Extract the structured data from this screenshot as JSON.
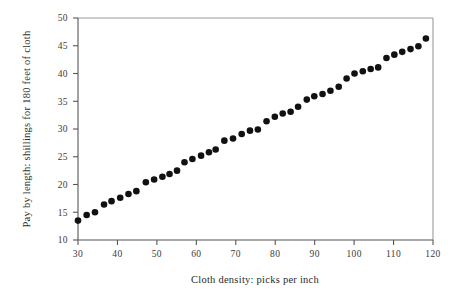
{
  "chart_data": {
    "type": "scatter",
    "title": "",
    "xlabel": "Cloth density: picks per inch",
    "ylabel": "Pay by length: shillings for 180 feet of cloth",
    "xlim": [
      30,
      120
    ],
    "ylim": [
      10,
      50
    ],
    "xticks": [
      30,
      40,
      50,
      60,
      70,
      80,
      90,
      100,
      110,
      120
    ],
    "yticks": [
      10,
      15,
      20,
      25,
      30,
      35,
      40,
      45,
      50
    ],
    "xtick_labels": [
      "30",
      "40",
      "50",
      "60",
      "70",
      "80",
      "90",
      "100",
      "110",
      "120"
    ],
    "ytick_labels": [
      "10",
      "15",
      "20",
      "25",
      "30",
      "35",
      "40",
      "45",
      "50"
    ],
    "grid": false,
    "legend": null,
    "marker": {
      "shape": "circle",
      "color": "#111111",
      "size": 3.3
    },
    "points": [
      {
        "x": 30.0,
        "y": 13.5
      },
      {
        "x": 32.2,
        "y": 14.5
      },
      {
        "x": 34.3,
        "y": 15.0
      },
      {
        "x": 36.6,
        "y": 16.4
      },
      {
        "x": 38.5,
        "y": 17.0
      },
      {
        "x": 40.7,
        "y": 17.6
      },
      {
        "x": 42.8,
        "y": 18.3
      },
      {
        "x": 44.8,
        "y": 18.8
      },
      {
        "x": 47.2,
        "y": 20.4
      },
      {
        "x": 49.3,
        "y": 20.9
      },
      {
        "x": 51.4,
        "y": 21.4
      },
      {
        "x": 53.2,
        "y": 21.9
      },
      {
        "x": 55.1,
        "y": 22.5
      },
      {
        "x": 57.0,
        "y": 24.0
      },
      {
        "x": 59.0,
        "y": 24.6
      },
      {
        "x": 61.2,
        "y": 25.2
      },
      {
        "x": 63.2,
        "y": 25.8
      },
      {
        "x": 64.9,
        "y": 26.3
      },
      {
        "x": 67.1,
        "y": 27.9
      },
      {
        "x": 69.3,
        "y": 28.3
      },
      {
        "x": 71.5,
        "y": 29.1
      },
      {
        "x": 73.6,
        "y": 29.7
      },
      {
        "x": 75.6,
        "y": 29.9
      },
      {
        "x": 77.8,
        "y": 31.4
      },
      {
        "x": 79.9,
        "y": 32.2
      },
      {
        "x": 81.9,
        "y": 32.8
      },
      {
        "x": 83.9,
        "y": 33.1
      },
      {
        "x": 85.8,
        "y": 34.0
      },
      {
        "x": 88.0,
        "y": 35.3
      },
      {
        "x": 89.9,
        "y": 35.9
      },
      {
        "x": 92.0,
        "y": 36.3
      },
      {
        "x": 94.0,
        "y": 36.9
      },
      {
        "x": 96.1,
        "y": 37.6
      },
      {
        "x": 98.1,
        "y": 39.1
      },
      {
        "x": 100.1,
        "y": 40.0
      },
      {
        "x": 102.2,
        "y": 40.4
      },
      {
        "x": 104.2,
        "y": 40.8
      },
      {
        "x": 106.1,
        "y": 41.1
      },
      {
        "x": 108.2,
        "y": 42.8
      },
      {
        "x": 110.2,
        "y": 43.4
      },
      {
        "x": 112.2,
        "y": 43.9
      },
      {
        "x": 114.3,
        "y": 44.4
      },
      {
        "x": 116.3,
        "y": 44.9
      },
      {
        "x": 118.2,
        "y": 46.3
      }
    ]
  }
}
